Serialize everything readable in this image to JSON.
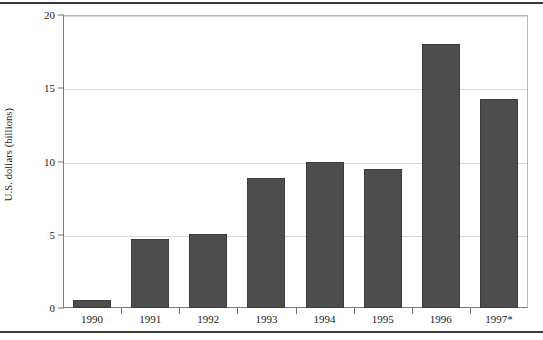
{
  "chart_data": {
    "type": "bar",
    "title": "",
    "xlabel": "",
    "ylabel": "U.S. dollars (billions)",
    "categories": [
      "1990",
      "1991",
      "1992",
      "1993",
      "1994",
      "1995",
      "1996",
      "1997*"
    ],
    "values": [
      0.55,
      4.7,
      5.05,
      8.9,
      10.0,
      9.5,
      18.0,
      14.3
    ],
    "ylim": [
      0,
      20
    ],
    "yticks": [
      0,
      5,
      10,
      15,
      20
    ],
    "ytick_labels": [
      "0",
      "5",
      "10",
      "15",
      "20"
    ],
    "grid": "horizontal",
    "legend": "none",
    "bar_color": "#4d4d4d",
    "bar_edge_color": "#3c3c3c",
    "gridline_color": "#d9d9d9",
    "axis_color": "#7d7d7d",
    "rule_color": "#3a3a3a",
    "annotations": [
      "* asterisk on 1997 category label indicates provisional or estimated value"
    ]
  }
}
